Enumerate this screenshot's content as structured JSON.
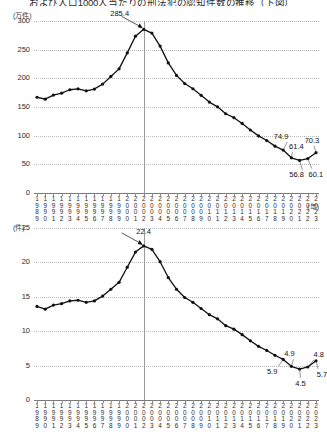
{
  "title": "および人口1000人当たりの刑法犯の認知件数の推移（下図）",
  "chart_data": [
    {
      "type": "line",
      "title": "および人口1000人当たりの刑法犯の認知件数の推移（下図）",
      "id": "top",
      "ylabel": "(万件)",
      "xlabel": "(年)",
      "ylim": [
        0,
        300
      ],
      "yticks": [
        0,
        50,
        100,
        150,
        200,
        250,
        300
      ],
      "grid": true,
      "legend": "none",
      "x": [
        1989,
        1990,
        1991,
        1992,
        1993,
        1994,
        1995,
        1996,
        1997,
        1998,
        1999,
        2000,
        2001,
        2002,
        2003,
        2004,
        2005,
        2006,
        2007,
        2008,
        2009,
        2010,
        2011,
        2012,
        2013,
        2014,
        2015,
        2016,
        2017,
        2018,
        2019,
        2020,
        2021,
        2022,
        2023
      ],
      "values": [
        167.0,
        163.7,
        170.8,
        174.2,
        180.1,
        181.7,
        178.2,
        181.3,
        189.9,
        203.3,
        216.5,
        244.4,
        273.5,
        285.4,
        279.0,
        256.2,
        226.9,
        205.1,
        190.9,
        181.8,
        170.4,
        158.6,
        150.3,
        138.2,
        131.4,
        121.3,
        109.9,
        99.6,
        91.5,
        81.7,
        74.9,
        61.4,
        56.8,
        60.1,
        70.3
      ],
      "annotations": [
        {
          "x": 2002,
          "value": 285.4,
          "label": "285.4"
        },
        {
          "x": 2019,
          "value": 74.9,
          "label": "74.9"
        },
        {
          "x": 2020,
          "value": 61.4,
          "label": "61.4"
        },
        {
          "x": 2021,
          "value": 56.8,
          "label": "56.8"
        },
        {
          "x": 2022,
          "value": 60.1,
          "label": "60.1"
        },
        {
          "x": 2023,
          "value": 70.3,
          "label": "70.3"
        }
      ],
      "reference_line_x": 2002
    },
    {
      "type": "line",
      "id": "bottom",
      "ylabel": "(件)",
      "xlabel": "",
      "ylim": [
        0,
        25
      ],
      "yticks": [
        0,
        5,
        10,
        15,
        20,
        25
      ],
      "grid": true,
      "legend": "none",
      "x": [
        1989,
        1990,
        1991,
        1992,
        1993,
        1994,
        1995,
        1996,
        1997,
        1998,
        1999,
        2000,
        2001,
        2002,
        2003,
        2004,
        2005,
        2006,
        2007,
        2008,
        2009,
        2010,
        2011,
        2012,
        2013,
        2014,
        2015,
        2016,
        2017,
        2018,
        2019,
        2020,
        2021,
        2022,
        2023
      ],
      "values": [
        13.6,
        13.2,
        13.8,
        14.0,
        14.4,
        14.5,
        14.2,
        14.4,
        15.1,
        16.1,
        17.1,
        19.3,
        21.5,
        22.4,
        21.9,
        20.1,
        17.8,
        16.1,
        14.9,
        14.2,
        13.3,
        12.4,
        11.8,
        10.8,
        10.3,
        9.5,
        8.6,
        7.8,
        7.2,
        6.5,
        5.9,
        4.9,
        4.5,
        4.8,
        5.7
      ],
      "annotations": [
        {
          "x": 2002,
          "value": 22.4,
          "label": "22.4"
        },
        {
          "x": 2019,
          "value": 5.9,
          "label": "5.9"
        },
        {
          "x": 2020,
          "value": 4.9,
          "label": "4.9"
        },
        {
          "x": 2021,
          "value": 4.5,
          "label": "4.5"
        },
        {
          "x": 2022,
          "value": 4.8,
          "label": "4.8"
        },
        {
          "x": 2023,
          "value": 5.7,
          "label": "5.7"
        }
      ],
      "reference_line_x": 2002
    }
  ],
  "axis_units": {
    "top_y": "(万件)",
    "top_x": "(年)",
    "bottom_y": "(件)"
  }
}
